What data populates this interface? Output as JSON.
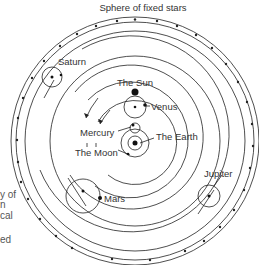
{
  "diagram": {
    "title": "Sphere of fixed stars",
    "labels": {
      "saturn": "Saturn",
      "sun": "The Sun",
      "venus": "Venus",
      "mercury": "Mercury",
      "earth": "The Earth",
      "moon": "The Moon",
      "mars": "Mars",
      "jupiter": "Jupiter"
    },
    "left_text_fragments": [
      "y of",
      "n",
      "cal",
      "ed"
    ],
    "colors": {
      "line": "#222222",
      "text": "#333333",
      "background": "#ffffff"
    }
  }
}
